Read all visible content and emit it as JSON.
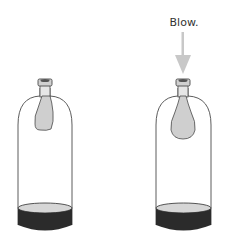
{
  "diagram": {
    "title": "",
    "panels": [
      {
        "id": "before",
        "description": "Bottle with deflated balloon hanging inside neck, dark base"
      },
      {
        "id": "after",
        "description": "Bottle with balloon inflated by blowing into neck",
        "annotation": "Blow."
      }
    ]
  },
  "colors": {
    "outline": "#4a4a4a",
    "balloon_fill": "#cfcfcf",
    "arrow": "#c8c8c8",
    "base_dark": "#2b2b2b",
    "base_top": "#d6d6d6"
  }
}
